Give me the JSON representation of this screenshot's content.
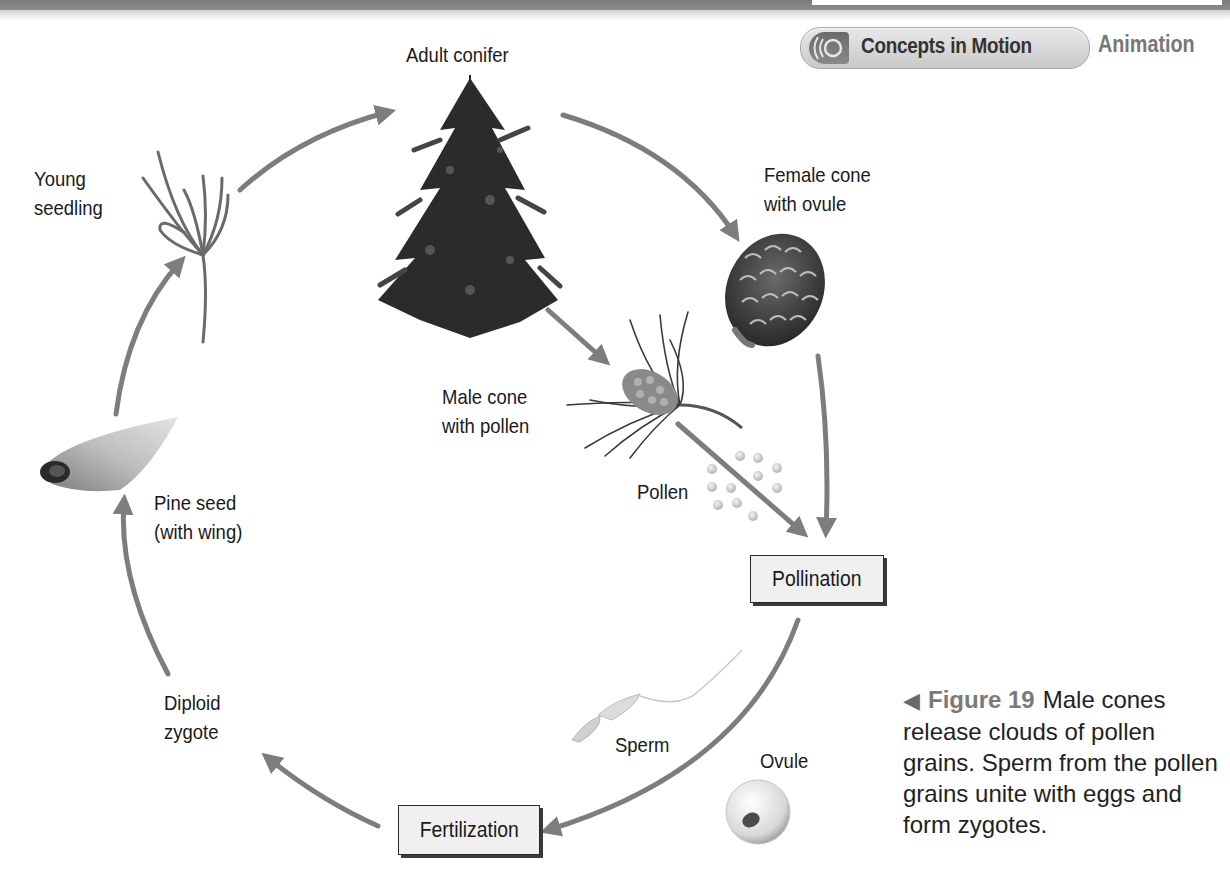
{
  "header": {
    "concepts_button": {
      "label": "Concepts in Motion",
      "icon": "sound-waves-icon"
    },
    "animation_label": "Animation"
  },
  "diagram": {
    "stages": {
      "adult_conifer": "Adult conifer",
      "female_cone": [
        "Female cone",
        "with ovule"
      ],
      "male_cone": [
        "Male cone",
        "with pollen"
      ],
      "pollen": "Pollen",
      "pollination": "Pollination",
      "sperm": "Sperm",
      "ovule": "Ovule",
      "fertilization": "Fertilization",
      "diploid_zygote": [
        "Diploid",
        "zygote"
      ],
      "pine_seed": [
        "Pine seed",
        "(with wing)"
      ],
      "young_seedling": [
        "Young",
        "seedling"
      ]
    },
    "arrow_color": "#7d7d7d",
    "box_fill": "#f0f0f0"
  },
  "caption": {
    "figure_number": "Figure 19",
    "text": "Male cones release clouds of pollen grains. Sperm from the pollen grains unite with eggs and form zygotes."
  }
}
